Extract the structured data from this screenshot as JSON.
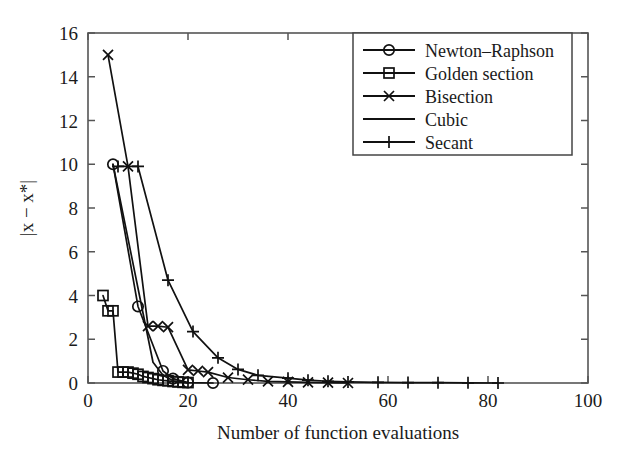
{
  "chart_data": {
    "type": "line",
    "title": "",
    "xlabel": "Number of function evaluations",
    "ylabel": "|x − x*|",
    "xlim": [
      0,
      100
    ],
    "ylim": [
      0,
      16
    ],
    "xticks": [
      0,
      20,
      40,
      60,
      80,
      100
    ],
    "yticks": [
      0,
      2,
      4,
      6,
      8,
      10,
      12,
      14,
      16
    ],
    "xtick_labels": [
      "0",
      "20",
      "40",
      "60",
      "80",
      "100"
    ],
    "ytick_labels": [
      "0",
      "2",
      "4",
      "6",
      "8",
      "10",
      "12",
      "14",
      "16"
    ],
    "grid": false,
    "legend_position": "upper right",
    "series": [
      {
        "name": "Newton–Raphson",
        "marker": "circle",
        "x": [
          5,
          10,
          15,
          17,
          20,
          25
        ],
        "y": [
          10.0,
          3.5,
          0.55,
          0.2,
          0.02,
          0.0
        ]
      },
      {
        "name": "Golden section",
        "marker": "square",
        "x": [
          3,
          4,
          5,
          6,
          7,
          8,
          9,
          10,
          11,
          12,
          13,
          14,
          15,
          16,
          17,
          18,
          19,
          20
        ],
        "y": [
          4.0,
          3.3,
          3.3,
          0.5,
          0.5,
          0.5,
          0.45,
          0.4,
          0.3,
          0.25,
          0.2,
          0.15,
          0.12,
          0.1,
          0.07,
          0.05,
          0.03,
          0.02
        ]
      },
      {
        "name": "Bisection",
        "marker": "cross",
        "x": [
          4,
          8,
          12,
          14,
          16,
          20,
          22,
          24,
          28,
          32,
          36,
          40,
          44,
          48,
          52
        ],
        "y": [
          15.0,
          9.9,
          2.6,
          2.6,
          2.55,
          0.6,
          0.55,
          0.5,
          0.25,
          0.15,
          0.07,
          0.05,
          0.03,
          0.02,
          0.0
        ]
      },
      {
        "name": "Cubic",
        "marker": "none",
        "x": [
          5,
          8,
          11,
          13,
          15,
          17,
          20
        ],
        "y": [
          10.0,
          6.6,
          3.2,
          0.95,
          0.35,
          0.1,
          0.0
        ]
      },
      {
        "name": "Secant",
        "marker": "plus",
        "x": [
          6,
          10,
          16,
          21,
          26,
          30,
          34,
          40,
          44,
          48,
          52,
          58,
          64,
          70,
          76,
          82
        ],
        "y": [
          9.9,
          9.9,
          4.7,
          2.35,
          1.15,
          0.62,
          0.35,
          0.22,
          0.13,
          0.08,
          0.05,
          0.03,
          0.02,
          0.015,
          0.01,
          0.0
        ]
      }
    ]
  },
  "legend": {
    "items": [
      {
        "label": "Newton–Raphson",
        "marker": "circle"
      },
      {
        "label": "Golden section",
        "marker": "square"
      },
      {
        "label": "Bisection",
        "marker": "cross"
      },
      {
        "label": "Cubic",
        "marker": "none"
      },
      {
        "label": "Secant",
        "marker": "plus"
      }
    ]
  },
  "colors": {
    "line": "#111111",
    "frame": "#555555",
    "background": "#ffffff",
    "text": "#1a1a1a"
  }
}
